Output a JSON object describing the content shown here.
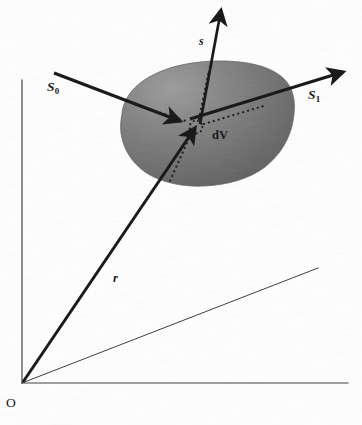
{
  "figure": {
    "kind": "scattering-geometry-diagram",
    "background_color": "#fefefe",
    "ink_color": "#151515",
    "blob_fill_light": "#c0c0c0",
    "blob_fill_dark": "#9a9a9a",
    "blob_edge_color": "#8f8f8f"
  },
  "labels": {
    "incident_beam": "S",
    "incident_beam_sub": "0",
    "scattered_beam": "S",
    "scattered_beam_sub": "1",
    "normal_vector": "s",
    "position_vector": "r",
    "volume_element": "dV",
    "origin": "O"
  },
  "axes": {
    "vertical": {
      "x1": 22,
      "y1": 80,
      "x2": 22,
      "y2": 383
    },
    "horizontal": {
      "x1": 22,
      "y1": 383,
      "x2": 348,
      "y2": 383
    },
    "depth_diagonal": {
      "x1": 22,
      "y1": 383,
      "x2": 318,
      "y2": 268
    },
    "stroke_width": 1.1,
    "color": "#3a3a3a"
  },
  "vectors": {
    "S0": {
      "x1": 54,
      "y1": 73,
      "x2": 182,
      "y2": 122,
      "arrow_at": "end",
      "stroke_width": 3.0,
      "label_at": [
        47,
        80
      ]
    },
    "S1": {
      "x1": 182,
      "y1": 122,
      "x2": 344,
      "y2": 73,
      "arrow_at": "end",
      "stroke_width": 3.0,
      "label_at": [
        308,
        88
      ]
    },
    "s": {
      "x1": 200,
      "y1": 124,
      "x2": 222,
      "y2": 8,
      "arrow_at": "end",
      "stroke_width": 2.6,
      "label_at": [
        199,
        35
      ]
    },
    "r": {
      "x1": 22,
      "y1": 383,
      "x2": 196,
      "y2": 126,
      "arrow_at": "end",
      "stroke_width": 3.0,
      "label_at": [
        113,
        272
      ]
    }
  },
  "volume_element_marker": {
    "center_x": 196,
    "center_y": 127,
    "radius": 6.5,
    "label": "dV",
    "label_at": [
      212,
      129
    ]
  },
  "dotted_rays": [
    {
      "name": "S0-inside",
      "x1": 137,
      "y1": 106,
      "x2": 190,
      "y2": 123
    },
    {
      "name": "S1-inside",
      "x1": 203,
      "y1": 124,
      "x2": 266,
      "y2": 105
    },
    {
      "name": "s-inside",
      "x1": 199,
      "y1": 120,
      "x2": 208,
      "y2": 72
    },
    {
      "name": "r-inside",
      "x1": 192,
      "y1": 133,
      "x2": 170,
      "y2": 182
    }
  ],
  "blob": {
    "description": "irregular gray amoeba-shaped scattering sample volume",
    "outline_points": [
      [
        128,
        104
      ],
      [
        140,
        88
      ],
      [
        160,
        75
      ],
      [
        186,
        66
      ],
      [
        214,
        62
      ],
      [
        240,
        62
      ],
      [
        262,
        67
      ],
      [
        280,
        77
      ],
      [
        291,
        92
      ],
      [
        294,
        110
      ],
      [
        290,
        128
      ],
      [
        280,
        146
      ],
      [
        265,
        161
      ],
      [
        247,
        172
      ],
      [
        226,
        180
      ],
      [
        204,
        184
      ],
      [
        182,
        184
      ],
      [
        162,
        180
      ],
      [
        145,
        172
      ],
      [
        132,
        160
      ],
      [
        123,
        145
      ],
      [
        120,
        128
      ],
      [
        122,
        114
      ]
    ]
  }
}
